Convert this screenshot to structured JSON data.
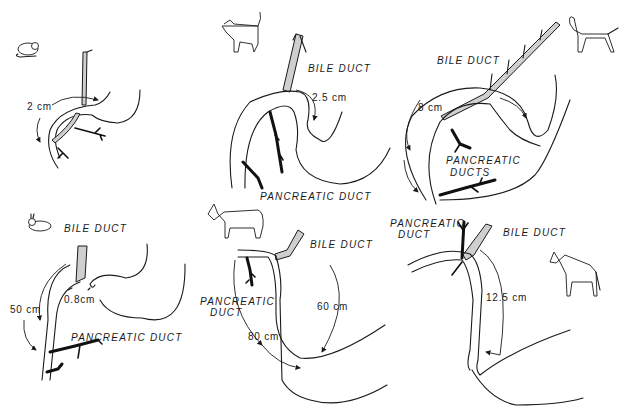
{
  "figure": {
    "panels": [
      {
        "id": "rat",
        "animal_icon": "rat-icon",
        "measurement": "2 cm",
        "labels": []
      },
      {
        "id": "cat",
        "animal_icon": "cat-icon",
        "measurement": "2.5 cm",
        "labels": [
          "BILE DUCT",
          "PANCREATIC DUCT"
        ]
      },
      {
        "id": "dog",
        "animal_icon": "dog-icon",
        "measurement": "8 cm",
        "labels": [
          "BILE DUCT",
          "PANCREATIC",
          "DUCTS"
        ]
      },
      {
        "id": "rabbit",
        "animal_icon": "rabbit-icon",
        "measurements": [
          "50 cm",
          "0.8cm"
        ],
        "labels": [
          "BILE DUCT",
          "PANCREATIC DUCT"
        ]
      },
      {
        "id": "cow",
        "animal_icon": "cow-icon",
        "measurements": [
          "60 cm",
          "80 cm"
        ],
        "labels": [
          "BILE DUCT",
          "PANCREATIC",
          "DUCT"
        ]
      },
      {
        "id": "horse",
        "animal_icon": "horse-icon",
        "measurement": "12.5 cm",
        "labels": [
          "PANCREATIC",
          "DUCT",
          "BILE DUCT"
        ]
      }
    ]
  }
}
